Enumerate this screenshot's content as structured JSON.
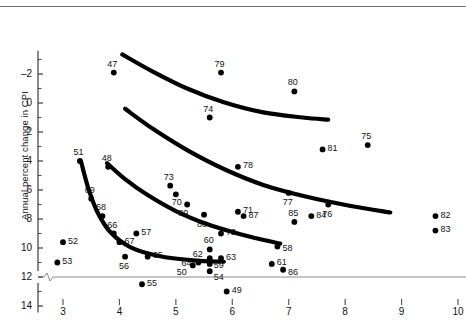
{
  "chart_data": {
    "type": "scatter",
    "title": "",
    "xlabel": "",
    "ylabel": "Annual percent change in CPI",
    "xlim": [
      2.6,
      10.2
    ],
    "ylim": [
      -2.6,
      15.6
    ],
    "xticks": [
      3,
      4,
      5,
      6,
      7,
      8,
      9,
      10
    ],
    "yticks": [
      -2,
      0,
      2,
      4,
      6,
      8,
      10,
      12,
      14
    ],
    "yminorticks": [
      -1,
      1,
      3,
      5,
      7,
      9,
      11,
      13,
      15
    ],
    "axis_break_at_y": 0,
    "grid": false,
    "legend": null,
    "point_color": "#000000",
    "curve_color": "#000000",
    "points": [
      {
        "label": "47",
        "x": 3.9,
        "y": 14.1
      },
      {
        "label": "48",
        "x": 3.8,
        "y": 7.6
      },
      {
        "label": "49",
        "x": 5.9,
        "y": -1.0
      },
      {
        "label": "50",
        "x": 5.3,
        "y": 0.8
      },
      {
        "label": "51",
        "x": 3.3,
        "y": 8.0
      },
      {
        "label": "52",
        "x": 3.0,
        "y": 2.4
      },
      {
        "label": "53",
        "x": 2.9,
        "y": 1.0
      },
      {
        "label": "54",
        "x": 5.6,
        "y": 0.4
      },
      {
        "label": "55",
        "x": 4.4,
        "y": -0.5
      },
      {
        "label": "56",
        "x": 4.1,
        "y": 1.4
      },
      {
        "label": "57",
        "x": 4.3,
        "y": 3.0
      },
      {
        "label": "58",
        "x": 6.8,
        "y": 2.1
      },
      {
        "label": "59",
        "x": 5.6,
        "y": 0.9
      },
      {
        "label": "60",
        "x": 5.6,
        "y": 1.9
      },
      {
        "label": "61",
        "x": 6.7,
        "y": 0.9
      },
      {
        "label": "62",
        "x": 5.6,
        "y": 1.3
      },
      {
        "label": "63",
        "x": 5.8,
        "y": 1.3
      },
      {
        "label": "64",
        "x": 5.4,
        "y": 1.0
      },
      {
        "label": "65",
        "x": 4.5,
        "y": 1.4
      },
      {
        "label": "66",
        "x": 3.9,
        "y": 3.0
      },
      {
        "label": "67",
        "x": 4.0,
        "y": 2.4
      },
      {
        "label": "68",
        "x": 3.7,
        "y": 4.2
      },
      {
        "label": "69",
        "x": 3.5,
        "y": 5.4
      },
      {
        "label": "70",
        "x": 5.0,
        "y": 5.7
      },
      {
        "label": "71",
        "x": 6.1,
        "y": 4.5
      },
      {
        "label": "72",
        "x": 5.8,
        "y": 3.0
      },
      {
        "label": "73",
        "x": 4.9,
        "y": 6.3
      },
      {
        "label": "74",
        "x": 5.6,
        "y": 11.0
      },
      {
        "label": "75",
        "x": 8.4,
        "y": 9.1
      },
      {
        "label": "76",
        "x": 7.7,
        "y": 5.0
      },
      {
        "label": "77",
        "x": 7.0,
        "y": 5.8
      },
      {
        "label": "78",
        "x": 6.1,
        "y": 7.6
      },
      {
        "label": "79",
        "x": 5.8,
        "y": 14.1
      },
      {
        "label": "80",
        "x": 7.1,
        "y": 12.8
      },
      {
        "label": "81",
        "x": 7.6,
        "y": 8.8
      },
      {
        "label": "82",
        "x": 9.6,
        "y": 4.2
      },
      {
        "label": "83",
        "x": 9.6,
        "y": 3.2
      },
      {
        "label": "84",
        "x": 7.4,
        "y": 4.2
      },
      {
        "label": "85",
        "x": 7.1,
        "y": 3.8
      },
      {
        "label": "86",
        "x": 6.9,
        "y": 0.5
      },
      {
        "label": "87",
        "x": 6.2,
        "y": 4.2
      },
      {
        "label": "88",
        "x": 5.5,
        "y": 4.3
      },
      {
        "label": "89",
        "x": 5.2,
        "y": 5.0
      }
    ],
    "curves": [
      {
        "name": "curve-1947-1969",
        "points": [
          [
            3.32,
            7.95
          ],
          [
            3.45,
            6.1
          ],
          [
            3.62,
            4.4
          ],
          [
            3.85,
            3.05
          ],
          [
            4.2,
            2.05
          ],
          [
            4.7,
            1.45
          ],
          [
            5.3,
            1.15
          ],
          [
            5.85,
            1.05
          ]
        ]
      },
      {
        "name": "curve-1970-1973",
        "points": [
          [
            3.78,
            7.85
          ],
          [
            4.1,
            6.75
          ],
          [
            4.5,
            5.65
          ],
          [
            5.0,
            4.55
          ],
          [
            5.55,
            3.65
          ],
          [
            6.05,
            3.05
          ],
          [
            6.5,
            2.6
          ],
          [
            6.85,
            2.3
          ]
        ]
      },
      {
        "name": "curve-1974-1977",
        "points": [
          [
            4.1,
            11.6
          ],
          [
            4.6,
            10.2
          ],
          [
            5.2,
            8.75
          ],
          [
            5.85,
            7.45
          ],
          [
            6.55,
            6.35
          ],
          [
            7.3,
            5.55
          ],
          [
            8.1,
            4.9
          ],
          [
            8.8,
            4.45
          ]
        ]
      },
      {
        "name": "curve-1978-1982",
        "points": [
          [
            4.05,
            15.35
          ],
          [
            4.6,
            14.15
          ],
          [
            5.2,
            13.0
          ],
          [
            5.85,
            12.05
          ],
          [
            6.55,
            11.35
          ],
          [
            7.25,
            11.0
          ],
          [
            7.7,
            10.85
          ]
        ]
      }
    ]
  },
  "axis": {
    "ylabel_text": "Annual percent change in CPI",
    "ytick_labels": [
      "14",
      "12",
      "10",
      "8",
      "6",
      "4",
      "2",
      "0",
      "–2"
    ],
    "xtick_labels": [
      "3",
      "4",
      "5",
      "6",
      "7",
      "8",
      "9",
      "10"
    ]
  }
}
